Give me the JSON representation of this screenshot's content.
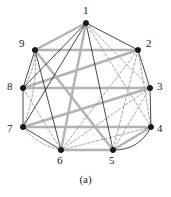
{
  "figure": {
    "caption": "(a)",
    "background_color": "#fefefe",
    "colors": {
      "node_fill": "#1a1a1a",
      "node_stroke": "#000000",
      "gray_edge": "#b3b3b3",
      "black_edge": "#1a1a1a",
      "dashed_edge": "#9a9a9a",
      "label_color": "#1a1a1a"
    }
  },
  "graph": {
    "type": "undirected-graph-drawing",
    "node_count": 9,
    "nodes": [
      {
        "id": "1",
        "label": "1",
        "x": 86,
        "y": 23,
        "label_x": 83,
        "label_y": 5
      },
      {
        "id": "2",
        "label": "2",
        "x": 138,
        "y": 50,
        "label_x": 146,
        "label_y": 38
      },
      {
        "id": "3",
        "label": "3",
        "x": 150,
        "y": 88,
        "label_x": 157,
        "label_y": 81
      },
      {
        "id": "4",
        "label": "4",
        "x": 151,
        "y": 127,
        "label_x": 157,
        "label_y": 123
      },
      {
        "id": "5",
        "label": "5",
        "x": 113,
        "y": 150,
        "label_x": 109,
        "label_y": 155
      },
      {
        "id": "6",
        "label": "6",
        "x": 61,
        "y": 150,
        "label_x": 57,
        "label_y": 155
      },
      {
        "id": "7",
        "label": "7",
        "x": 23,
        "y": 127,
        "label_x": 7,
        "label_y": 123
      },
      {
        "id": "8",
        "label": "8",
        "x": 23,
        "y": 88,
        "label_x": 7,
        "label_y": 81
      },
      {
        "id": "9",
        "label": "9",
        "x": 35,
        "y": 50,
        "label_x": 19,
        "label_y": 38
      }
    ],
    "edges_gray_thick": [
      {
        "from": "1",
        "to": "9"
      },
      {
        "from": "9",
        "to": "2"
      },
      {
        "from": "8",
        "to": "3"
      },
      {
        "from": "7",
        "to": "4"
      },
      {
        "from": "6",
        "to": "5"
      },
      {
        "from": "9",
        "to": "5"
      },
      {
        "from": "8",
        "to": "2"
      },
      {
        "from": "7",
        "to": "3"
      },
      {
        "from": "6",
        "to": "1"
      },
      {
        "from": "5",
        "to": "4"
      }
    ],
    "edges_black_solid": [
      {
        "from": "1",
        "to": "2"
      },
      {
        "from": "2",
        "to": "3"
      },
      {
        "from": "3",
        "to": "4"
      },
      {
        "from": "7",
        "to": "8"
      },
      {
        "from": "8",
        "to": "9"
      },
      {
        "from": "6",
        "to": "7"
      },
      {
        "from": "1",
        "to": "5"
      },
      {
        "from": "1",
        "to": "7"
      },
      {
        "from": "1",
        "to": "8"
      },
      {
        "from": "9",
        "to": "6"
      }
    ],
    "edges_black_curved": [
      {
        "from": "5",
        "to": "4",
        "bow": 14
      }
    ],
    "edges_dashed": [
      {
        "from": "1",
        "to": "3"
      },
      {
        "from": "1",
        "to": "4"
      },
      {
        "from": "2",
        "to": "5"
      },
      {
        "from": "2",
        "to": "4"
      },
      {
        "from": "3",
        "to": "5"
      },
      {
        "from": "3",
        "to": "6"
      },
      {
        "from": "2",
        "to": "6"
      },
      {
        "from": "4",
        "to": "6"
      },
      {
        "from": "9",
        "to": "7",
        "bow": -9
      },
      {
        "from": "8",
        "to": "6"
      },
      {
        "from": "7",
        "to": "6",
        "bow": 8
      },
      {
        "from": "9",
        "to": "8",
        "bow": -6
      }
    ]
  }
}
